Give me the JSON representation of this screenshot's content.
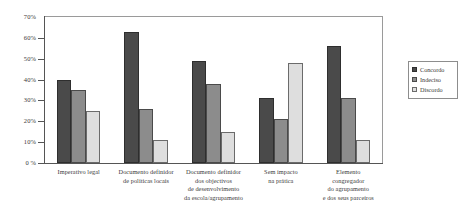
{
  "chart_data": {
    "type": "bar",
    "title": "",
    "subtitle": "",
    "xlabel": "",
    "ylabel": "",
    "ylim": [
      0,
      70
    ],
    "ytick_values": [
      0,
      10,
      20,
      30,
      40,
      50,
      60,
      70
    ],
    "ytick_labels": [
      "0 %",
      "10%",
      "20%",
      "30%",
      "40%",
      "50%",
      "60%",
      "70%"
    ],
    "grid": false,
    "legend_position": "right-outside",
    "categories": [
      "Imperativo legal",
      "Documento definidor de políticas locais",
      "Documento definidor dos objectivos de desenvolvimento da escola/agrupamento",
      "Sem impacto na prática",
      "Elemento congregador do agrupamento e dos seus parceiros"
    ],
    "category_lines": [
      [
        "Imperativo legal"
      ],
      [
        "Documento definidor",
        "de políticas locais"
      ],
      [
        "Documento definidor",
        "dos objectivos",
        "de desenvolvimento",
        "da escola/agrupamento"
      ],
      [
        "Sem impacto",
        "na prática"
      ],
      [
        "Elemento",
        "congregador",
        "do agrupamento",
        "e dos seus parceiros"
      ]
    ],
    "series": [
      {
        "name": "Concordo",
        "color": "#4a4a4a",
        "values": [
          40,
          63,
          49,
          31,
          56
        ]
      },
      {
        "name": "Indeciso",
        "color": "#8c8c8c",
        "values": [
          35,
          26,
          38,
          21,
          31
        ]
      },
      {
        "name": "Discordo",
        "color": "#dedede",
        "values": [
          25,
          11,
          15,
          48,
          11
        ]
      }
    ]
  },
  "legend": {
    "items": [
      {
        "label": "Concordo"
      },
      {
        "label": "Indeciso"
      },
      {
        "label": "Discordo"
      }
    ]
  }
}
